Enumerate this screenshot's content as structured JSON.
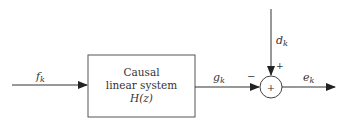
{
  "diagram": {
    "type": "block-diagram",
    "block": {
      "line1": "Causal",
      "line2": "linear system",
      "line3": "H(z)"
    },
    "signals": {
      "input": {
        "main": "f",
        "sub": "k"
      },
      "block_output": {
        "main": "g",
        "sub": "k"
      },
      "disturbance": {
        "main": "d",
        "sub": "k"
      },
      "error": {
        "main": "e",
        "sub": "k"
      }
    },
    "summing_junction": {
      "symbol": "+",
      "sign_left": "−",
      "sign_top": "+"
    },
    "colors": {
      "stroke": "#333333",
      "background": "#ffffff"
    }
  }
}
